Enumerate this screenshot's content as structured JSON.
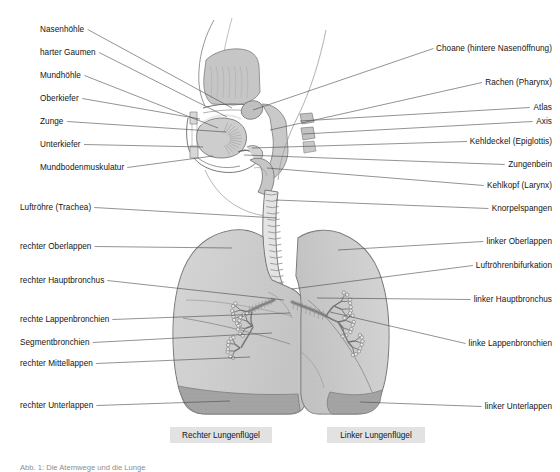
{
  "labels_left": [
    {
      "id": "nasenhoehle",
      "text": "Nasenhöhle",
      "x": 40,
      "y": 25,
      "anchor_x": 232,
      "anchor_y": 108
    },
    {
      "id": "harter-gaumen",
      "text": "harter Gaumen",
      "x": 40,
      "y": 48,
      "anchor_x": 227,
      "anchor_y": 117
    },
    {
      "id": "mundhoehle",
      "text": "Mundhöhle",
      "x": 40,
      "y": 71,
      "anchor_x": 218,
      "anchor_y": 128
    },
    {
      "id": "oberkiefer",
      "text": "Oberkiefer",
      "x": 40,
      "y": 94,
      "anchor_x": 200,
      "anchor_y": 119
    },
    {
      "id": "zunge",
      "text": "Zunge",
      "x": 40,
      "y": 117,
      "anchor_x": 226,
      "anchor_y": 132
    },
    {
      "id": "unterkiefer",
      "text": "Unterkiefer",
      "x": 40,
      "y": 140,
      "anchor_x": 203,
      "anchor_y": 147
    },
    {
      "id": "mundbodenmuskulatur",
      "text": "Mundbodenmuskulatur",
      "x": 40,
      "y": 163,
      "anchor_x": 213,
      "anchor_y": 156
    },
    {
      "id": "luftroehre",
      "text": "Luftröhre (Trachea)",
      "x": 20,
      "y": 203,
      "anchor_x": 277,
      "anchor_y": 218
    },
    {
      "id": "rechter-oberlappen",
      "text": "rechter Oberlappen",
      "x": 20,
      "y": 242,
      "anchor_x": 232,
      "anchor_y": 248
    },
    {
      "id": "rechter-hauptbronchus",
      "text": "rechter Hauptbronchus",
      "x": 20,
      "y": 276,
      "anchor_x": 284,
      "anchor_y": 300
    },
    {
      "id": "rechte-lappenbronchien",
      "text": "rechte Lappenbronchien",
      "x": 20,
      "y": 315,
      "anchor_x": 290,
      "anchor_y": 313
    },
    {
      "id": "segmentbronchien",
      "text": "Segmentbronchien",
      "x": 20,
      "y": 338,
      "anchor_x": 272,
      "anchor_y": 333
    },
    {
      "id": "rechter-mittellappen",
      "text": "rechter Mittellappen",
      "x": 20,
      "y": 359,
      "anchor_x": 250,
      "anchor_y": 357
    },
    {
      "id": "rechter-unterlappen",
      "text": "rechter Unterlappen",
      "x": 20,
      "y": 401,
      "anchor_x": 230,
      "anchor_y": 401
    }
  ],
  "labels_right": [
    {
      "id": "choane",
      "text": "Choane (hintere Nasenöffnung)",
      "x": 552,
      "y": 44,
      "anchor_x": 253,
      "anchor_y": 110
    },
    {
      "id": "rachen",
      "text": "Rachen (Pharynx)",
      "x": 552,
      "y": 78,
      "anchor_x": 270,
      "anchor_y": 130
    },
    {
      "id": "atlas",
      "text": "Atlas",
      "x": 552,
      "y": 103,
      "anchor_x": 300,
      "anchor_y": 121
    },
    {
      "id": "axis",
      "text": "Axis",
      "x": 552,
      "y": 117,
      "anchor_x": 303,
      "anchor_y": 134
    },
    {
      "id": "kehldeckel",
      "text": "Kehldeckel (Epiglottis)",
      "x": 552,
      "y": 137,
      "anchor_x": 252,
      "anchor_y": 148
    },
    {
      "id": "zungenbein",
      "text": "Zungenbein",
      "x": 552,
      "y": 160,
      "anchor_x": 244,
      "anchor_y": 155
    },
    {
      "id": "kehlkopf",
      "text": "Kehlkopf (Larynx)",
      "x": 552,
      "y": 181,
      "anchor_x": 267,
      "anchor_y": 168
    },
    {
      "id": "knorpelspangen",
      "text": "Knorpelspangen",
      "x": 552,
      "y": 204,
      "anchor_x": 276,
      "anchor_y": 200
    },
    {
      "id": "linker-oberlappen",
      "text": "linker Oberlappen",
      "x": 552,
      "y": 237,
      "anchor_x": 338,
      "anchor_y": 250
    },
    {
      "id": "luftroehrenbifurkation",
      "text": "Luftröhrenbifurkation",
      "x": 552,
      "y": 261,
      "anchor_x": 292,
      "anchor_y": 289
    },
    {
      "id": "linker-hauptbronchus",
      "text": "linker Hauptbronchus",
      "x": 552,
      "y": 295,
      "anchor_x": 317,
      "anchor_y": 298
    },
    {
      "id": "linke-lappenbronchien",
      "text": "linke Lappenbronchien",
      "x": 552,
      "y": 339,
      "anchor_x": 330,
      "anchor_y": 312
    },
    {
      "id": "linker-unterlappen",
      "text": "linker Unterlappen",
      "x": 552,
      "y": 402,
      "anchor_x": 360,
      "anchor_y": 402
    }
  ],
  "captions": [
    {
      "id": "rechter-lungenfluegel",
      "text": "Rechter Lungenflügel",
      "x": 170,
      "y": 427,
      "w": 102,
      "h": 16
    },
    {
      "id": "linker-lungenfluegel",
      "text": "Linker Lungenflügel",
      "x": 327,
      "y": 427,
      "w": 98,
      "h": 16
    }
  ],
  "figure_caption": {
    "text": "Abb. 1: Die Atemwege und die Lunge",
    "x": 20,
    "y": 463
  },
  "colors": {
    "lung_fill": "#cfcfcf",
    "lung_fill_light": "#dcdcdc",
    "lung_lower_lobe": "#a4a4a4",
    "outline": "#6b6b6b",
    "leader_line": "#4a4a4a",
    "caption_bg": "#e2e2e2",
    "text": "#141414",
    "bone": "#c4c4c4",
    "cartilage": "#e8e8e8"
  }
}
